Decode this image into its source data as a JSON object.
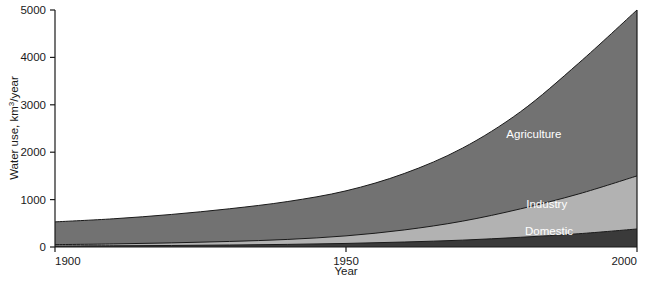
{
  "chart_data": {
    "type": "area",
    "stacked": true,
    "title": "",
    "subtitle": "",
    "xlabel": "Year",
    "ylabel": "Water use, km3/year",
    "ylabel_parts": {
      "prefix": "Water use, km",
      "superscript": "3",
      "suffix": "/year"
    },
    "xlim": [
      1900,
      2000
    ],
    "ylim": [
      0,
      5000
    ],
    "grid": false,
    "legend_position": "in-plot-right",
    "xticks": [
      1900,
      1950,
      2000
    ],
    "xtick_labels": [
      "1900",
      "1950",
      "2000"
    ],
    "yticks": [
      0,
      1000,
      2000,
      3000,
      4000,
      5000
    ],
    "ytick_labels": [
      "0",
      "1000",
      "2000",
      "3000",
      "4000",
      "5000"
    ],
    "x": [
      1900,
      1910,
      1920,
      1930,
      1940,
      1950,
      1960,
      1970,
      1980,
      1990,
      2000
    ],
    "series": [
      {
        "name": "Domestic",
        "color": "#3a3a3a",
        "values": [
          20,
          25,
          32,
          42,
          55,
          75,
          105,
          145,
          205,
          280,
          380
        ]
      },
      {
        "name": "Industry",
        "color": "#b2b2b2",
        "values": [
          30,
          40,
          55,
          75,
          105,
          160,
          255,
          400,
          600,
          840,
          1120
        ]
      },
      {
        "name": "Agriculture",
        "color": "#727272",
        "values": [
          480,
          530,
          600,
          690,
          800,
          950,
          1190,
          1540,
          2050,
          2760,
          3500
        ]
      }
    ],
    "totals": [
      530,
      595,
      687,
      807,
      960,
      1185,
      1550,
      2085,
      2855,
      3880,
      5000
    ],
    "annotations": [
      {
        "text": "Agriculture",
        "x": 1987,
        "y": 2300
      },
      {
        "text": "Industry",
        "x": 1988,
        "y": 830
      },
      {
        "text": "Domestic",
        "x": 1989,
        "y": 250
      }
    ],
    "colors": {
      "domestic": "#3a3a3a",
      "industry": "#b2b2b2",
      "agriculture": "#727272",
      "axis": "#1a1a1a",
      "background": "#ffffff",
      "label_text": "#ffffff"
    }
  }
}
